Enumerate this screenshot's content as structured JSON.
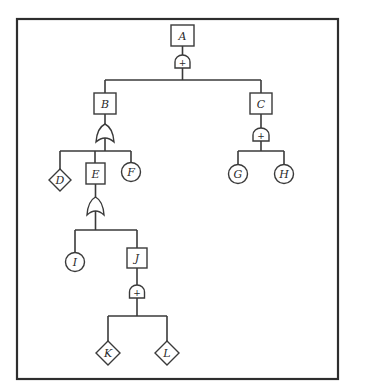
{
  "diagram": {
    "type": "fault-tree",
    "colors": {
      "line": "#3a3a3a",
      "frame": "#2e2e2e",
      "background": "#ffffff",
      "text": "#2a2a2a"
    },
    "nodes": {
      "A": {
        "label": "A",
        "shape": "rectangle",
        "role": "top-event",
        "gate": "AND"
      },
      "B": {
        "label": "B",
        "shape": "rectangle",
        "role": "intermediate-event",
        "gate": "OR"
      },
      "C": {
        "label": "C",
        "shape": "rectangle",
        "role": "intermediate-event",
        "gate": "AND"
      },
      "D": {
        "label": "D",
        "shape": "diamond",
        "role": "undeveloped-event"
      },
      "E": {
        "label": "E",
        "shape": "rectangle",
        "role": "intermediate-event",
        "gate": "OR"
      },
      "F": {
        "label": "F",
        "shape": "circle",
        "role": "basic-event"
      },
      "G": {
        "label": "G",
        "shape": "circle",
        "role": "basic-event"
      },
      "H": {
        "label": "H",
        "shape": "circle",
        "role": "basic-event"
      },
      "I": {
        "label": "I",
        "shape": "circle",
        "role": "basic-event"
      },
      "J": {
        "label": "J",
        "shape": "rectangle",
        "role": "intermediate-event",
        "gate": "AND"
      },
      "K": {
        "label": "K",
        "shape": "diamond",
        "role": "undeveloped-event"
      },
      "L": {
        "label": "L",
        "shape": "diamond",
        "role": "undeveloped-event"
      }
    },
    "gate_symbols": {
      "and": "+"
    },
    "edges": [
      [
        "A",
        "B"
      ],
      [
        "A",
        "C"
      ],
      [
        "B",
        "D"
      ],
      [
        "B",
        "E"
      ],
      [
        "B",
        "F"
      ],
      [
        "C",
        "G"
      ],
      [
        "C",
        "H"
      ],
      [
        "E",
        "I"
      ],
      [
        "E",
        "J"
      ],
      [
        "J",
        "K"
      ],
      [
        "J",
        "L"
      ]
    ]
  }
}
